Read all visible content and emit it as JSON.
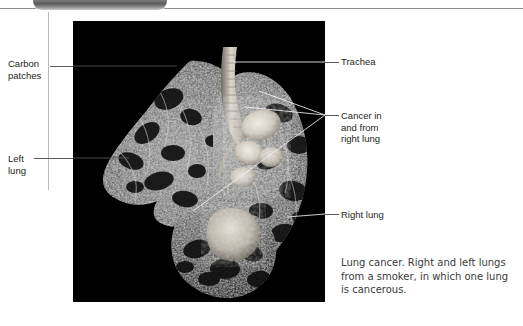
{
  "header": {
    "tab_label": "",
    "tab_color": "#5c5c5c",
    "rule_color": "#8e8e8e"
  },
  "figure": {
    "photo_background": "#000000",
    "photo_alt": "Dissected right and left lungs from a smoker, left lung cancerous",
    "watermark_text": ""
  },
  "annotations": [
    {
      "id": "carbon-patches",
      "label": "Carbon\npatches",
      "side": "left"
    },
    {
      "id": "left-lung",
      "label": "Left\nlung",
      "side": "left"
    },
    {
      "id": "trachea",
      "label": "Trachea",
      "side": "right"
    },
    {
      "id": "cancer",
      "label": "Cancer in\nand from\nright lung",
      "side": "right"
    },
    {
      "id": "right-lung",
      "label": "Right lung",
      "side": "right"
    }
  ],
  "caption": {
    "text": "Lung cancer. Right and left lungs from a smoker, in which one lung is cancerous."
  }
}
